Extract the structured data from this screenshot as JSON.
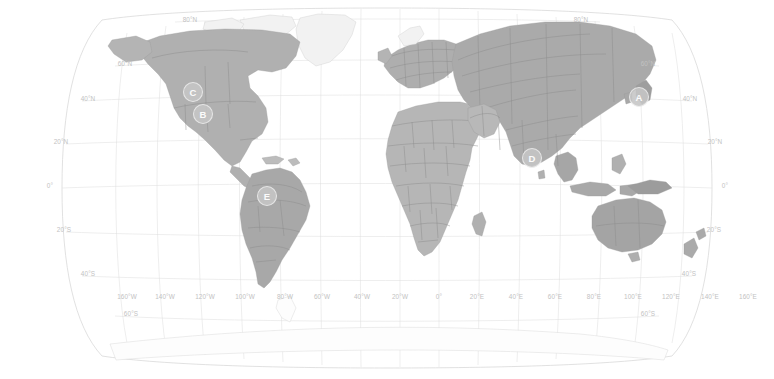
{
  "map": {
    "title": "World Map",
    "projection": "Robinson",
    "background_color": "#ffffff",
    "land_color": "#b9b9b9",
    "border_color": "#8a8a8a",
    "graticule_color": "#dcdcdc",
    "label_color": "#c2c2c2",
    "marker_fill": "#c6c6c6",
    "marker_text_color": "#fbfbfb"
  },
  "latitude_labels_left": [
    {
      "text": "80°N",
      "x": 190,
      "y": 22
    },
    {
      "text": "60°N",
      "x": 125,
      "y": 66
    },
    {
      "text": "40°N",
      "x": 88,
      "y": 101
    },
    {
      "text": "20°N",
      "x": 61,
      "y": 144
    },
    {
      "text": "0°",
      "x": 50,
      "y": 188
    },
    {
      "text": "20°S",
      "x": 64,
      "y": 232
    },
    {
      "text": "40°S",
      "x": 88,
      "y": 276
    },
    {
      "text": "60°S",
      "x": 131,
      "y": 316
    }
  ],
  "latitude_labels_right": [
    {
      "text": "80°N",
      "x": 581,
      "y": 22
    },
    {
      "text": "60°N",
      "x": 648,
      "y": 66
    },
    {
      "text": "40°N",
      "x": 690,
      "y": 101
    },
    {
      "text": "20°N",
      "x": 715,
      "y": 144
    },
    {
      "text": "0°",
      "x": 725,
      "y": 188
    },
    {
      "text": "20°S",
      "x": 714,
      "y": 232
    },
    {
      "text": "40°S",
      "x": 689,
      "y": 276
    },
    {
      "text": "60°S",
      "x": 648,
      "y": 316
    }
  ],
  "longitude_labels": [
    {
      "text": "160°W",
      "x": 127,
      "y": 299
    },
    {
      "text": "140°W",
      "x": 165,
      "y": 299
    },
    {
      "text": "120°W",
      "x": 205,
      "y": 299
    },
    {
      "text": "100°W",
      "x": 245,
      "y": 299
    },
    {
      "text": "80°W",
      "x": 285,
      "y": 299
    },
    {
      "text": "60°W",
      "x": 322,
      "y": 299
    },
    {
      "text": "40°W",
      "x": 362,
      "y": 299
    },
    {
      "text": "20°W",
      "x": 400,
      "y": 299
    },
    {
      "text": "0°",
      "x": 439,
      "y": 299
    },
    {
      "text": "20°E",
      "x": 477,
      "y": 299
    },
    {
      "text": "40°E",
      "x": 516,
      "y": 299
    },
    {
      "text": "60°E",
      "x": 555,
      "y": 299
    },
    {
      "text": "80°E",
      "x": 594,
      "y": 299
    },
    {
      "text": "100°E",
      "x": 633,
      "y": 299
    },
    {
      "text": "120°E",
      "x": 671,
      "y": 299
    },
    {
      "text": "140°E",
      "x": 710,
      "y": 299
    },
    {
      "text": "160°E",
      "x": 748,
      "y": 299
    }
  ],
  "markers": [
    {
      "id": "marker-a",
      "label": "A",
      "x": 639,
      "y": 97,
      "r": 9.5,
      "region": "Japan"
    },
    {
      "id": "marker-b",
      "label": "B",
      "x": 203,
      "y": 114,
      "r": 9.5,
      "region": "Western United States"
    },
    {
      "id": "marker-c",
      "label": "C",
      "x": 193,
      "y": 92,
      "r": 9.5,
      "region": "Northwestern United States"
    },
    {
      "id": "marker-d",
      "label": "D",
      "x": 532,
      "y": 158,
      "r": 9.5,
      "region": "India"
    },
    {
      "id": "marker-e",
      "label": "E",
      "x": 267,
      "y": 196,
      "r": 9.5,
      "region": "Amazon Basin, Brazil"
    }
  ]
}
